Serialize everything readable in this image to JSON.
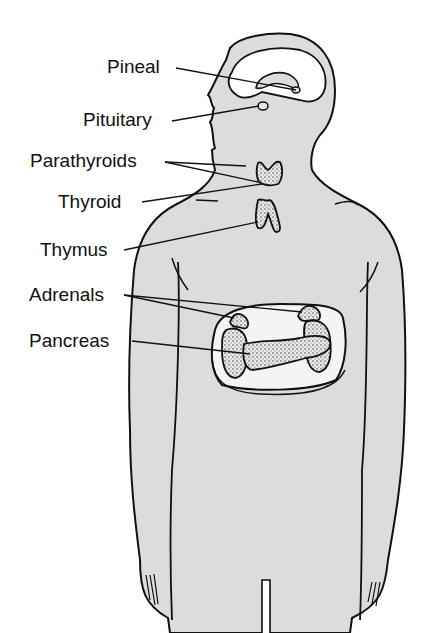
{
  "diagram": {
    "colors": {
      "body_fill": "#dcdcdc",
      "outline": "#111111",
      "organ_window": "#f4f4f4",
      "gland_fill": "#e6e6e6",
      "background": "#ffffff"
    },
    "labels": [
      {
        "id": "pineal",
        "text": "Pineal"
      },
      {
        "id": "pituitary",
        "text": "Pituitary"
      },
      {
        "id": "parathyroids",
        "text": "Parathyroids"
      },
      {
        "id": "thyroid",
        "text": "Thyroid"
      },
      {
        "id": "thymus",
        "text": "Thymus"
      },
      {
        "id": "adrenals",
        "text": "Adrenals"
      },
      {
        "id": "pancreas",
        "text": "Pancreas"
      }
    ]
  }
}
